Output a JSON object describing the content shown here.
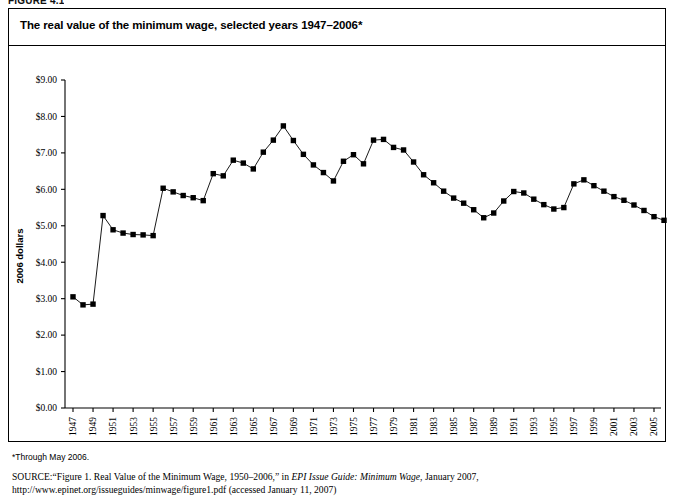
{
  "figure": {
    "label": "FIGURE 4.1",
    "title": "The real value of the minimum wage, selected years 1947–2006*",
    "footnote": "*Through May 2006.",
    "source_kicker": "SOURCE:",
    "source_text_1": "“Figure 1. Real Value of the Minimum Wage, 1950–2006,” in ",
    "source_italic": "EPI Issue Guide: Minimum Wage",
    "source_text_2": ", January 2007, http://www.epinet.org/",
    "source_text_3": "issueguides/minwage/figure1.pdf (accessed January 11, 2007)"
  },
  "colors": {
    "line": "#000000",
    "marker": "#000000",
    "axis": "#000000",
    "background": "#ffffff"
  },
  "chart_data": {
    "type": "line",
    "title": "The real value of the minimum wage, selected years 1947–2006*",
    "xlabel": "",
    "ylabel": "2006 dollars",
    "ylim": [
      0,
      9
    ],
    "ytick_step": 1,
    "ytick_labels": [
      "$0.00",
      "$1.00",
      "$2.00",
      "$3.00",
      "$4.00",
      "$5.00",
      "$6.00",
      "$7.00",
      "$8.00",
      "$9.00"
    ],
    "ytick_values": [
      0,
      1,
      2,
      3,
      4,
      5,
      6,
      7,
      8,
      9
    ],
    "xlim": [
      1947,
      2006
    ],
    "xtick_labels": [
      "1947",
      "1949",
      "1951",
      "1953",
      "1955",
      "1957",
      "1959",
      "1961",
      "1963",
      "1965",
      "1967",
      "1969",
      "1971",
      "1973",
      "1975",
      "1977",
      "1979",
      "1981",
      "1983",
      "1985",
      "1987",
      "1989",
      "1991",
      "1993",
      "1995",
      "1997",
      "1999",
      "2001",
      "2003",
      "2005"
    ],
    "xtick_values": [
      1947,
      1949,
      1951,
      1953,
      1955,
      1957,
      1959,
      1961,
      1963,
      1965,
      1967,
      1969,
      1971,
      1973,
      1975,
      1977,
      1979,
      1981,
      1983,
      1985,
      1987,
      1989,
      1991,
      1993,
      1995,
      1997,
      1999,
      2001,
      2003,
      2005
    ],
    "grid": false,
    "legend": false,
    "marker": "square",
    "series": [
      {
        "name": "Real value of the minimum wage (2006 dollars)",
        "x": [
          1947,
          1948,
          1949,
          1950,
          1951,
          1952,
          1953,
          1954,
          1955,
          1956,
          1957,
          1958,
          1959,
          1960,
          1961,
          1962,
          1963,
          1964,
          1965,
          1966,
          1967,
          1968,
          1969,
          1970,
          1971,
          1972,
          1973,
          1974,
          1975,
          1976,
          1977,
          1978,
          1979,
          1980,
          1981,
          1982,
          1983,
          1984,
          1985,
          1986,
          1987,
          1988,
          1989,
          1990,
          1991,
          1992,
          1993,
          1994,
          1995,
          1996,
          1997,
          1998,
          1999,
          2000,
          2001,
          2002,
          2003,
          2004,
          2005,
          2006
        ],
        "values": [
          3.05,
          2.83,
          2.85,
          5.28,
          4.89,
          4.8,
          4.76,
          4.75,
          4.73,
          6.03,
          5.93,
          5.83,
          5.77,
          5.69,
          6.43,
          6.37,
          6.8,
          6.72,
          6.56,
          7.02,
          7.35,
          7.74,
          7.34,
          6.96,
          6.67,
          6.46,
          6.23,
          6.77,
          6.95,
          6.7,
          7.35,
          7.37,
          7.15,
          7.08,
          6.75,
          6.4,
          6.18,
          5.95,
          5.76,
          5.62,
          5.44,
          5.22,
          5.35,
          5.68,
          5.94,
          5.9,
          5.73,
          5.58,
          5.46,
          5.5,
          6.15,
          6.26,
          6.1,
          5.95,
          5.8,
          5.7,
          5.57,
          5.42,
          5.25,
          5.15
        ]
      }
    ]
  }
}
